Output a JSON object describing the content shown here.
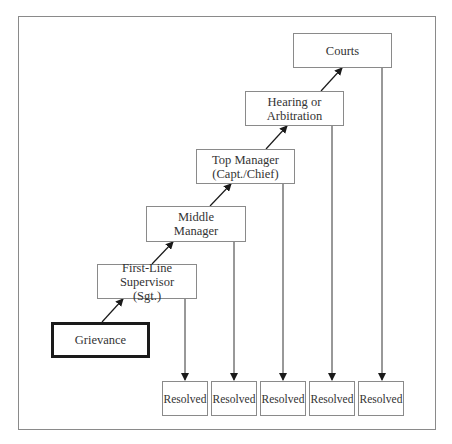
{
  "diagram": {
    "type": "grievance-escalation-flow",
    "colors": {
      "border": "#8a8a8a",
      "text": "#333333",
      "emphasis_border": "#1a1a1a",
      "arrow": "#1a1a1a"
    },
    "steps": [
      {
        "id": "grievance",
        "lines": [
          "Grievance"
        ]
      },
      {
        "id": "first-line-supervisor",
        "lines": [
          "First-Line Supervisor",
          "(Sgt.)"
        ]
      },
      {
        "id": "middle-manager",
        "lines": [
          "Middle",
          "Manager"
        ]
      },
      {
        "id": "top-manager",
        "lines": [
          "Top Manager",
          "(Capt./Chief)"
        ]
      },
      {
        "id": "hearing-arbitration",
        "lines": [
          "Hearing or",
          "Arbitration"
        ]
      },
      {
        "id": "courts",
        "lines": [
          "Courts"
        ]
      }
    ],
    "outcomes": [
      {
        "label": "Resolved"
      },
      {
        "label": "Resolved"
      },
      {
        "label": "Resolved"
      },
      {
        "label": "Resolved"
      },
      {
        "label": "Resolved"
      }
    ]
  }
}
